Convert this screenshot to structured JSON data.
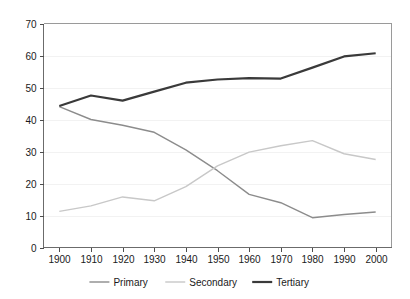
{
  "chart_data": {
    "type": "line",
    "title": "",
    "xlabel": "",
    "ylabel": "",
    "xlim": [
      1895,
      2005
    ],
    "ylim": [
      0,
      70
    ],
    "grid": true,
    "legend_position": "bottom",
    "x_ticks": [
      "1900",
      "1910",
      "1920",
      "1930",
      "1940",
      "1950",
      "1960",
      "1970",
      "1980",
      "1990",
      "2000"
    ],
    "y_ticks": [
      "0",
      "10",
      "20",
      "30",
      "40",
      "50",
      "60",
      "70"
    ],
    "x": [
      1900,
      1910,
      1920,
      1930,
      1940,
      1950,
      1960,
      1970,
      1980,
      1990,
      2000
    ],
    "series": [
      {
        "name": "Primary",
        "color": "#8c8c8c",
        "width": 1.4,
        "values": [
          44.0,
          40.0,
          38.2,
          36.0,
          30.5,
          24.0,
          16.6,
          14.0,
          9.3,
          10.3,
          11.1
        ]
      },
      {
        "name": "Secondary",
        "color": "#c8c8c8",
        "width": 1.4,
        "values": [
          11.3,
          13.0,
          15.8,
          14.6,
          19.0,
          25.5,
          29.8,
          31.8,
          33.4,
          29.3,
          27.5
        ]
      },
      {
        "name": "Tertiary",
        "color": "#3a3a3a",
        "width": 2.2,
        "values": [
          44.2,
          47.5,
          45.9,
          48.7,
          51.5,
          52.5,
          52.9,
          52.8,
          56.2,
          59.7,
          60.7
        ]
      }
    ]
  },
  "legend": {
    "items": [
      {
        "label": "Primary"
      },
      {
        "label": "Secondary"
      },
      {
        "label": "Tertiary"
      }
    ]
  },
  "axes": {
    "y_axis_name": "y-axis",
    "x_axis_name": "x-axis"
  }
}
